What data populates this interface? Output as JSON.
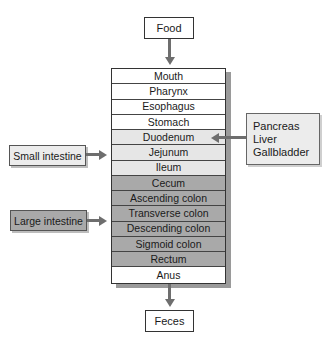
{
  "input": {
    "label": "Food"
  },
  "output": {
    "label": "Feces"
  },
  "tract": [
    {
      "label": "Mouth",
      "group": "upper"
    },
    {
      "label": "Pharynx",
      "group": "upper"
    },
    {
      "label": "Esophagus",
      "group": "upper"
    },
    {
      "label": "Stomach",
      "group": "upper"
    },
    {
      "label": "Duodenum",
      "group": "small-intestine"
    },
    {
      "label": "Jejunum",
      "group": "small-intestine"
    },
    {
      "label": "Ileum",
      "group": "small-intestine"
    },
    {
      "label": "Cecum",
      "group": "large-intestine"
    },
    {
      "label": "Ascending colon",
      "group": "large-intestine"
    },
    {
      "label": "Transverse colon",
      "group": "large-intestine"
    },
    {
      "label": "Descending colon",
      "group": "large-intestine"
    },
    {
      "label": "Sigmoid colon",
      "group": "large-intestine"
    },
    {
      "label": "Rectum",
      "group": "large-intestine"
    },
    {
      "label": "Anus",
      "group": "lower"
    }
  ],
  "labels": {
    "small_intestine": "Small intestine",
    "large_intestine": "Large intestine"
  },
  "accessory_organs": {
    "items": [
      "Pancreas",
      "Liver",
      "Gallbladder"
    ],
    "target": "Duodenum"
  },
  "colors": {
    "upper": "#ffffff",
    "small_intestine": "#e6e6e6",
    "large_intestine": "#a9a9a9",
    "arrow": "#6e6e6e"
  }
}
